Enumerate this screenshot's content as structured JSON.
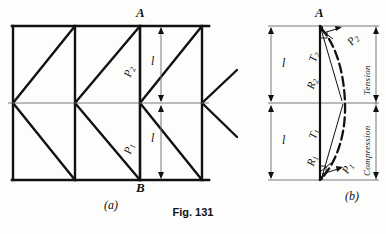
{
  "figure": {
    "caption": "Fig. 131",
    "part_a_label": "(a)",
    "part_b_label": "(b)"
  },
  "truss": {
    "node_top_label": "A",
    "node_bottom_label": "B",
    "dim_upper_label": "l",
    "dim_lower_label": "l",
    "force_upper_main": "P",
    "force_upper_sub": "2",
    "force_lower_main": "P",
    "force_lower_sub": "1"
  },
  "force_diagram": {
    "node_top_label": "A",
    "dim_upper_label": "l",
    "dim_lower_label": "l",
    "zone_upper_label": "Tension",
    "zone_lower_label": "Compression",
    "vectors": [
      {
        "name": "P2",
        "main": "P",
        "sub": "2"
      },
      {
        "name": "T2",
        "main": "T",
        "sub": "2"
      },
      {
        "name": "R2",
        "main": "R",
        "sub": "2"
      },
      {
        "name": "P1",
        "main": "P",
        "sub": "1"
      },
      {
        "name": "T1",
        "main": "T",
        "sub": "1"
      },
      {
        "name": "R1",
        "main": "R",
        "sub": "1"
      }
    ]
  },
  "colors": {
    "ink": "#111111",
    "thin_rule": "#6a6a6a",
    "paper": "#fdfdfb"
  }
}
